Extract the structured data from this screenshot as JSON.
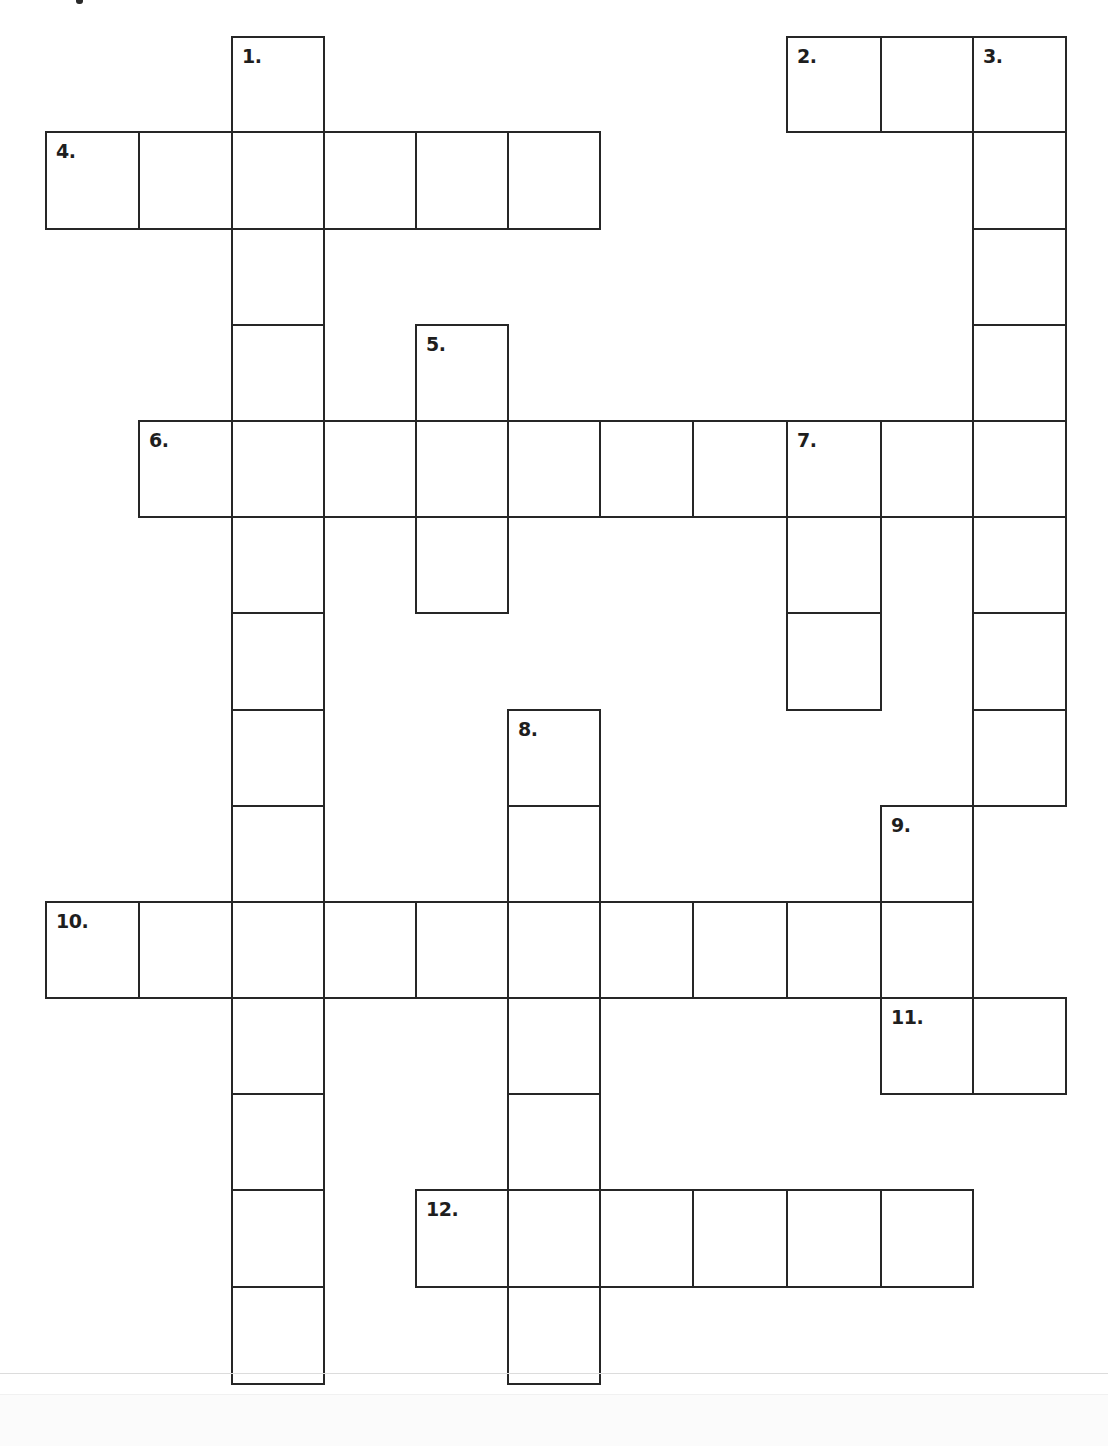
{
  "puzzle": {
    "type": "crossword",
    "grid_columns": 11,
    "grid_rows": 14,
    "colors": {
      "line": "#262626",
      "cell_fill": "#ffffff",
      "number": "#1e1e1e",
      "background": "#ffffff"
    },
    "words": [
      {
        "number": 1,
        "label": "1.",
        "direction": "down",
        "row": 0,
        "col": 2,
        "length": 14
      },
      {
        "number": 2,
        "label": "2.",
        "direction": "across",
        "row": 0,
        "col": 8,
        "length": 3
      },
      {
        "number": 3,
        "label": "3.",
        "direction": "down",
        "row": 0,
        "col": 10,
        "length": 8
      },
      {
        "number": 4,
        "label": "4.",
        "direction": "across",
        "row": 1,
        "col": 0,
        "length": 6
      },
      {
        "number": 5,
        "label": "5.",
        "direction": "down",
        "row": 3,
        "col": 4,
        "length": 3
      },
      {
        "number": 6,
        "label": "6.",
        "direction": "across",
        "row": 4,
        "col": 1,
        "length": 10
      },
      {
        "number": 7,
        "label": "7.",
        "direction": "down",
        "row": 4,
        "col": 8,
        "length": 3
      },
      {
        "number": 8,
        "label": "8.",
        "direction": "down",
        "row": 7,
        "col": 5,
        "length": 7
      },
      {
        "number": 9,
        "label": "9.",
        "direction": "down",
        "row": 8,
        "col": 9,
        "length": 3
      },
      {
        "number": 10,
        "label": "10.",
        "direction": "across",
        "row": 9,
        "col": 0,
        "length": 10
      },
      {
        "number": 11,
        "label": "11.",
        "direction": "across",
        "row": 10,
        "col": 9,
        "length": 2
      },
      {
        "number": 12,
        "label": "12.",
        "direction": "across",
        "row": 12,
        "col": 4,
        "length": 6
      }
    ],
    "entries": {}
  }
}
